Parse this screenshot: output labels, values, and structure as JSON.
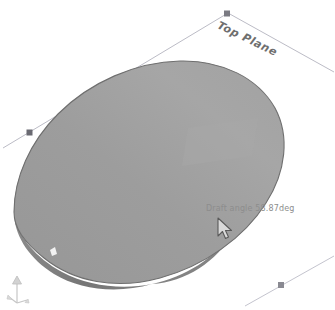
{
  "viewport": {
    "background_color": "#ffffff",
    "width": 335,
    "height": 310
  },
  "reference_plane": {
    "label": "Top Plane",
    "line_color": "#b9b9c4",
    "handle_color": "#6a6a72",
    "handles": [
      {
        "name": "plane-handle-left",
        "x": 30,
        "y": 133
      },
      {
        "name": "plane-handle-top",
        "x": 227,
        "y": 14
      },
      {
        "name": "plane-handle-bottom-right",
        "x": 281,
        "y": 285
      }
    ]
  },
  "model": {
    "name": "drafted-surface",
    "face_color": "#9a9a9a",
    "face_color_light": "#a8a8a8",
    "edge_color": "#6d6d6d",
    "rim_color": "#7d7d7d",
    "highlight_color": "#b0b0b0"
  },
  "tooltip": {
    "name": "draft-angle-tooltip",
    "text": "Draft angle 58.87deg",
    "color": "#8d8d8d"
  },
  "cursor": {
    "name": "arrow-cursor",
    "type": "arrow-pointer",
    "x": 216,
    "y": 216
  },
  "triad": {
    "name": "coordinate-triad",
    "color": "#c9c9c9"
  }
}
